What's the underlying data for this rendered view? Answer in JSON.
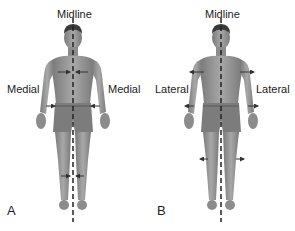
{
  "figures": [
    {
      "id": "A",
      "letter": "A",
      "midline_label": "Midline",
      "left_label": "Medial",
      "right_label": "Medial",
      "arrow_direction": "toward-midline",
      "arrow_locations": [
        "chest",
        "waist",
        "knees"
      ]
    },
    {
      "id": "B",
      "letter": "B",
      "midline_label": "Midline",
      "left_label": "Lateral",
      "right_label": "Lateral",
      "arrow_direction": "away-from-midline",
      "arrow_locations": [
        "shoulders",
        "hips",
        "knees"
      ]
    }
  ],
  "colors": {
    "skin": "#9a9a9a",
    "skin_dark": "#6e6e6e",
    "hair": "#3a3a3a",
    "midline": "#222222",
    "arrow": "#333333",
    "text": "#222222"
  }
}
